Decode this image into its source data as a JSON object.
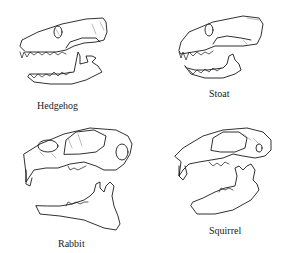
{
  "figure": {
    "panels": [
      {
        "id": "hedgehog",
        "label": "Hedgehog"
      },
      {
        "id": "stoat",
        "label": "Stoat"
      },
      {
        "id": "rabbit",
        "label": "Rabbit"
      },
      {
        "id": "squirrel",
        "label": "Squirrel"
      }
    ]
  }
}
